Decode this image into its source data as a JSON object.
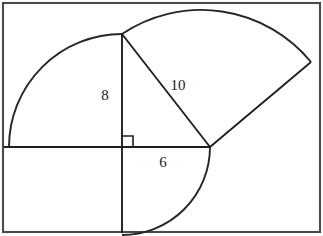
{
  "figure": {
    "background_color": "#ffffff",
    "frame": {
      "name": "outer-border",
      "color": "#4a4a4a",
      "x": 3,
      "y": 3,
      "width": 317,
      "height": 229
    },
    "stroke_color": "#1f1f1f",
    "arc_color": "#262626",
    "labels": {
      "vertical_leg": "8",
      "hypotenuse": "10",
      "horizontal_leg": "6"
    },
    "label_positions": {
      "vertical_leg": {
        "x": 105,
        "y": 100
      },
      "hypotenuse": {
        "x": 168,
        "y": 90
      },
      "horizontal_leg": {
        "x": 157,
        "y": 167
      }
    },
    "points": {
      "right_angle_vertex": {
        "x": 122,
        "y": 147
      },
      "apex_top": {
        "x": 122,
        "y": 34
      },
      "right_vertex": {
        "x": 210,
        "y": 147
      },
      "left_arc_end": {
        "x": 5,
        "y": 147
      },
      "bottom_arc_end": {
        "x": 122,
        "y": 235
      },
      "upper_right_arc_end": {
        "x": 311,
        "y": 62
      }
    },
    "lines": [
      {
        "name": "vertical-leg-line",
        "x1": 122,
        "y1": 34,
        "x2": 122,
        "y2": 147
      },
      {
        "name": "vertical-extension-line",
        "x1": 122,
        "y1": 147,
        "x2": 122,
        "y2": 233
      },
      {
        "name": "horizontal-leg-line",
        "x1": 122,
        "y1": 147,
        "x2": 210,
        "y2": 147
      },
      {
        "name": "horizontal-extension-line",
        "x1": 4,
        "y1": 147,
        "x2": 122,
        "y2": 147
      },
      {
        "name": "hypotenuse-line",
        "x1": 122,
        "y1": 34,
        "x2": 210,
        "y2": 147
      },
      {
        "name": "radius-line",
        "x1": 210,
        "y1": 147,
        "x2": 311,
        "y2": 62
      }
    ],
    "arcs": [
      {
        "name": "leg-8-quarter-arc",
        "center": {
          "x": 122,
          "y": 147
        },
        "radius": 113,
        "path": "M 122 34 A 113 113 0 0 0 9 147"
      },
      {
        "name": "leg-6-quarter-arc",
        "center": {
          "x": 122,
          "y": 147
        },
        "radius": 88,
        "path": "M 210 147 A 88 88 0 0 1 122 235"
      },
      {
        "name": "hypotenuse-10-arc",
        "center": {
          "x": 210,
          "y": 147
        },
        "radius": 142,
        "path": "M 122 34 A 142 142 0 0 1 311 62"
      }
    ],
    "right_angle_marker": {
      "name": "right-angle-square",
      "path": "M 122 136 L 133 136 L 133 147"
    }
  }
}
